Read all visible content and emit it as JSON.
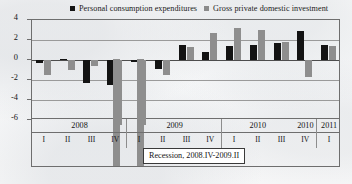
{
  "legend": {
    "items": [
      {
        "label": "Personal consumption expenditures",
        "color": "#131313",
        "icon": "square-marker-icon"
      },
      {
        "label": "Gross private domestic investment",
        "color": "#8e8e8e",
        "icon": "square-marker-icon"
      }
    ]
  },
  "annotation": {
    "text": "Recession, 2008.IV-2009.II"
  },
  "axis": {
    "y_ticks": [
      "4",
      "2",
      "0",
      "-2",
      "-4",
      "-6"
    ],
    "year_labels": [
      "2008",
      "2009",
      "2010",
      "2010",
      "2011"
    ],
    "quarter_labels": [
      "I",
      "II",
      "III",
      "IV",
      "I",
      "II",
      "III",
      "IV",
      "I",
      "II",
      "III",
      "IV",
      "I"
    ]
  },
  "chart_data": {
    "type": "bar",
    "title": "",
    "xlabel": "",
    "ylabel": "",
    "ylim": [
      -6,
      4
    ],
    "yticks": [
      4,
      2,
      0,
      -2,
      -4,
      -6
    ],
    "grid": true,
    "legend_position": "top",
    "categories": [
      "2008 I",
      "2008 II",
      "2008 III",
      "2008 IV",
      "2009 I",
      "2009 II",
      "2009 III",
      "2009 IV",
      "2010 I",
      "2010 II",
      "2010 III",
      "2010 IV",
      "2011 I"
    ],
    "series": [
      {
        "name": "Personal consumption expenditures",
        "color": "#131313",
        "values": [
          -0.3,
          0.1,
          -2.3,
          -2.5,
          -0.2,
          -0.9,
          1.5,
          0.8,
          1.4,
          1.5,
          1.7,
          2.9,
          1.5
        ]
      },
      {
        "name": "Gross private domestic investment",
        "color": "#8e8e8e",
        "values": [
          -1.5,
          -1.0,
          -0.6,
          -6.5,
          -6.5,
          -1.5,
          1.3,
          2.7,
          3.2,
          3.0,
          1.8,
          -1.7,
          1.4
        ]
      }
    ],
    "annotations": [
      {
        "text": "Recession, 2008.IV-2009.II",
        "type": "text-box"
      }
    ]
  }
}
